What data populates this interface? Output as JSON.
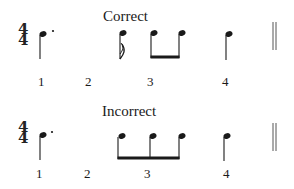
{
  "examples": [
    {
      "label": "Correct",
      "time_signature": {
        "top": "4",
        "bottom": "4"
      },
      "beats": [
        "1",
        "2",
        "3",
        "4"
      ],
      "notes": [
        "dotted-quarter",
        "sixteenth",
        "eighth-beamed",
        "eighth-beamed",
        "quarter"
      ],
      "ending": "double-barline"
    },
    {
      "label": "Incorrect",
      "time_signature": {
        "top": "4",
        "bottom": "4"
      },
      "beats": [
        "1",
        "2",
        "3",
        "4"
      ],
      "notes": [
        "dotted-quarter",
        "sixteenth-beamed",
        "eighth-beamed",
        "eighth-beamed",
        "quarter"
      ],
      "ending": "double-barline"
    }
  ],
  "colors": {
    "ink": "#1a1a1a",
    "background": "#ffffff"
  }
}
